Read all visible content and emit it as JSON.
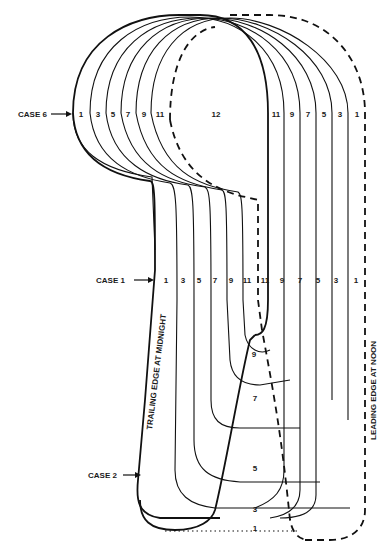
{
  "diagram": {
    "type": "nested-contour-diagram",
    "case_labels": {
      "case6": "CASE 6",
      "case1": "CASE 1",
      "case2": "CASE 2"
    },
    "edge_labels": {
      "trailing": "TRAILING EDGE AT MIDNIGHT",
      "leading": "LEADING EDGE AT NOON"
    },
    "case6_row": {
      "left": [
        "1",
        "3",
        "5",
        "7",
        "9",
        "11"
      ],
      "center": "12",
      "right": [
        "11",
        "9",
        "7",
        "5",
        "3",
        "1"
      ]
    },
    "case1_row": {
      "left": [
        "1",
        "3",
        "5",
        "7",
        "9",
        "11"
      ],
      "right": [
        "11",
        "9",
        "7",
        "5",
        "3",
        "1"
      ]
    },
    "bottom_stack": [
      "9",
      "7",
      "5",
      "3",
      "1"
    ],
    "colors": {
      "line": "#111111",
      "background": "#ffffff"
    }
  }
}
